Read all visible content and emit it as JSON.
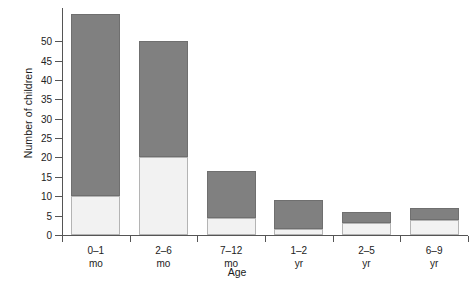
{
  "chart_data": {
    "type": "bar",
    "stacked": true,
    "title": "",
    "xlabel": "Age",
    "ylabel": "Number of children",
    "categories": [
      "0–1\nmo",
      "2–6\nmo",
      "7–12\nmo",
      "1–2\nyr",
      "2–5\nyr",
      "6–9\nyr"
    ],
    "category_lines": [
      {
        "line1": "0–1",
        "line2": "mo"
      },
      {
        "line1": "2–6",
        "line2": "mo"
      },
      {
        "line1": "7–12",
        "line2": "mo"
      },
      {
        "line1": "1–2",
        "line2": "yr"
      },
      {
        "line1": "2–5",
        "line2": "yr"
      },
      {
        "line1": "6–9",
        "line2": "yr"
      }
    ],
    "series": [
      {
        "name": "lower-segment",
        "color": "#f2f2f2",
        "values": [
          10,
          20,
          4.5,
          1.5,
          3,
          4
        ]
      },
      {
        "name": "upper-segment",
        "color": "#808080",
        "values": [
          47,
          30,
          12,
          7.5,
          3,
          3
        ]
      }
    ],
    "totals": [
      57,
      50,
      16.5,
      9,
      6,
      7
    ],
    "ylim": [
      0,
      58.8
    ],
    "yticks": [
      0,
      5,
      10,
      15,
      20,
      25,
      30,
      35,
      40,
      45,
      50
    ],
    "ytick_labels": [
      "0",
      "5",
      "10",
      "15",
      "20",
      "25",
      "30",
      "35",
      "40",
      "45",
      "50"
    ],
    "grid": false,
    "legend": "none"
  },
  "colors": {
    "dark_segment": "#808080",
    "light_segment": "#f2f2f2",
    "axis": "#555555",
    "background": "#ffffff",
    "text": "#222222"
  }
}
